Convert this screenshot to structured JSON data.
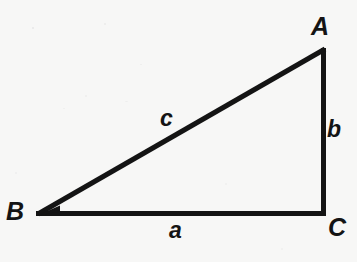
{
  "figure": {
    "background_color": "#f7f7f6",
    "stroke_color": "#141414",
    "stroke_width": 5
  },
  "chart_data": {
    "type": "diagram",
    "title": "",
    "shape": "right triangle",
    "vertices": [
      {
        "name": "A",
        "x": 325,
        "y": 48
      },
      {
        "name": "B",
        "x": 37,
        "y": 214
      },
      {
        "name": "C",
        "x": 324,
        "y": 214
      }
    ],
    "sides": [
      {
        "name": "a",
        "from": "B",
        "to": "C",
        "description": "base / horizontal leg"
      },
      {
        "name": "b",
        "from": "A",
        "to": "C",
        "description": "vertical leg"
      },
      {
        "name": "c",
        "from": "A",
        "to": "B",
        "description": "hypotenuse"
      }
    ],
    "right_angle_at": "C"
  },
  "labels": {
    "vertex_a": "A",
    "vertex_b": "B",
    "vertex_c": "C",
    "side_a": "a",
    "side_b": "b",
    "side_c": "c"
  }
}
